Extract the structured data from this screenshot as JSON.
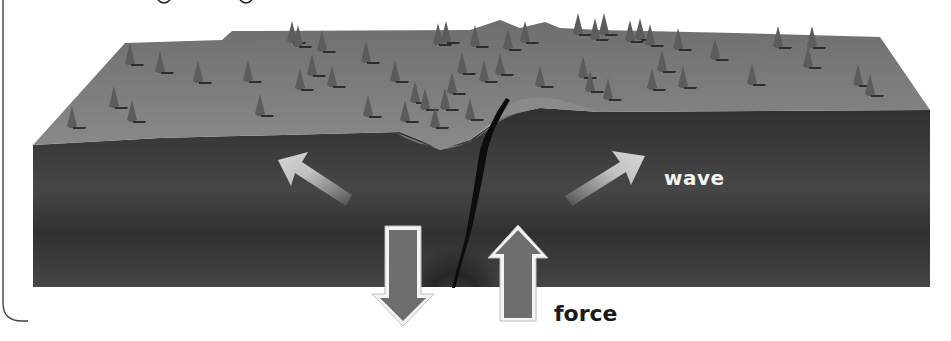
{
  "figure": {
    "labels": {
      "wave": "wave",
      "force": "force"
    },
    "arrows": [
      {
        "name": "wave-arrow-left",
        "direction": "up-left",
        "color": "#c9c9c9"
      },
      {
        "name": "wave-arrow-right",
        "direction": "up-right",
        "color": "#c9c9c9"
      },
      {
        "name": "force-arrow-down",
        "direction": "down",
        "color": "#6e6e6e"
      },
      {
        "name": "force-arrow-up",
        "direction": "up",
        "color": "#6e6e6e"
      }
    ],
    "colors": {
      "surface": "#7a7a7a",
      "front_face": "#3a3a3a",
      "fault": "#0d0d0d",
      "tree": "#5a5a5a",
      "bracket": "#444444"
    }
  }
}
